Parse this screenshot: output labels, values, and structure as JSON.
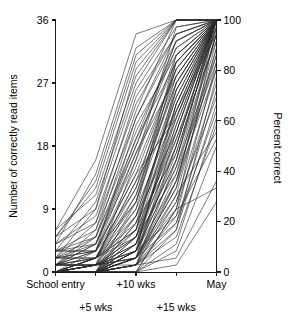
{
  "chart_data": {
    "type": "line",
    "title": "",
    "subtitle": "",
    "xlabel": "",
    "ylabel": "Number of correctly read items",
    "ylabel_right": "Percent correct",
    "categories": [
      "School entry",
      "+5 wks",
      "+10 wks",
      "+15 wks",
      "May"
    ],
    "x": [
      0,
      1,
      2,
      3,
      4
    ],
    "ylim": [
      0,
      36
    ],
    "yticks": [
      0,
      9,
      18,
      27,
      36
    ],
    "yticklabels": [
      "0",
      "9",
      "18",
      "27",
      "36"
    ],
    "ylim_right": [
      0,
      100
    ],
    "yticks_right": [
      0,
      20,
      40,
      60,
      80,
      100
    ],
    "yticklabels_right": [
      "0",
      "20",
      "40",
      "60",
      "80",
      "100"
    ],
    "grid": false,
    "legend": "none",
    "line_color": "#2b2b2b",
    "series": [
      {
        "name": "child-01",
        "values": [
          0,
          0,
          1,
          16,
          36
        ]
      },
      {
        "name": "child-02",
        "values": [
          0,
          0,
          2,
          20,
          36
        ]
      },
      {
        "name": "child-03",
        "values": [
          0,
          1,
          3,
          24,
          36
        ]
      },
      {
        "name": "child-04",
        "values": [
          0,
          0,
          0,
          9,
          35
        ]
      },
      {
        "name": "child-05",
        "values": [
          1,
          2,
          6,
          27,
          36
        ]
      },
      {
        "name": "child-06",
        "values": [
          0,
          0,
          4,
          22,
          36
        ]
      },
      {
        "name": "child-07",
        "values": [
          2,
          3,
          12,
          30,
          36
        ]
      },
      {
        "name": "child-08",
        "values": [
          0,
          1,
          2,
          14,
          34
        ]
      },
      {
        "name": "child-09",
        "values": [
          0,
          0,
          1,
          11,
          32
        ]
      },
      {
        "name": "child-10",
        "values": [
          3,
          5,
          18,
          33,
          36
        ]
      },
      {
        "name": "child-11",
        "values": [
          0,
          0,
          3,
          18,
          36
        ]
      },
      {
        "name": "child-12",
        "values": [
          1,
          1,
          8,
          25,
          36
        ]
      },
      {
        "name": "child-13",
        "values": [
          0,
          2,
          10,
          28,
          36
        ]
      },
      {
        "name": "child-14",
        "values": [
          0,
          0,
          0,
          6,
          28
        ]
      },
      {
        "name": "child-15",
        "values": [
          4,
          7,
          22,
          34,
          36
        ]
      },
      {
        "name": "child-16",
        "values": [
          0,
          1,
          5,
          21,
          36
        ]
      },
      {
        "name": "child-17",
        "values": [
          0,
          0,
          2,
          13,
          33
        ]
      },
      {
        "name": "child-18",
        "values": [
          2,
          4,
          16,
          31,
          36
        ]
      },
      {
        "name": "child-19",
        "values": [
          0,
          0,
          1,
          8,
          30
        ]
      },
      {
        "name": "child-20",
        "values": [
          1,
          3,
          14,
          29,
          36
        ]
      },
      {
        "name": "child-21",
        "values": [
          0,
          0,
          7,
          26,
          36
        ]
      },
      {
        "name": "child-22",
        "values": [
          5,
          9,
          26,
          35,
          36
        ]
      },
      {
        "name": "child-23",
        "values": [
          0,
          1,
          4,
          19,
          35
        ]
      },
      {
        "name": "child-24",
        "values": [
          0,
          0,
          2,
          12,
          31
        ]
      },
      {
        "name": "child-25",
        "values": [
          0,
          2,
          9,
          23,
          36
        ]
      },
      {
        "name": "child-26",
        "values": [
          1,
          1,
          3,
          15,
          34
        ]
      },
      {
        "name": "child-27",
        "values": [
          0,
          0,
          0,
          4,
          22
        ]
      },
      {
        "name": "child-28",
        "values": [
          3,
          6,
          20,
          32,
          36
        ]
      },
      {
        "name": "child-29",
        "values": [
          0,
          0,
          1,
          10,
          29
        ]
      },
      {
        "name": "child-30",
        "values": [
          2,
          2,
          11,
          27,
          36
        ]
      },
      {
        "name": "child-31",
        "values": [
          0,
          1,
          6,
          24,
          36
        ]
      },
      {
        "name": "child-32",
        "values": [
          0,
          0,
          3,
          17,
          35
        ]
      },
      {
        "name": "child-33",
        "values": [
          1,
          4,
          17,
          30,
          36
        ]
      },
      {
        "name": "child-34",
        "values": [
          0,
          0,
          2,
          7,
          26
        ]
      },
      {
        "name": "child-35",
        "values": [
          6,
          11,
          28,
          36,
          36
        ]
      },
      {
        "name": "child-36",
        "values": [
          0,
          0,
          5,
          20,
          36
        ]
      },
      {
        "name": "child-37",
        "values": [
          0,
          2,
          13,
          28,
          36
        ]
      },
      {
        "name": "child-38",
        "values": [
          1,
          1,
          2,
          9,
          27
        ]
      },
      {
        "name": "child-39",
        "values": [
          0,
          0,
          8,
          25,
          36
        ]
      },
      {
        "name": "child-40",
        "values": [
          2,
          5,
          19,
          33,
          36
        ]
      },
      {
        "name": "child-41",
        "values": [
          0,
          1,
          1,
          5,
          21
        ]
      },
      {
        "name": "child-42",
        "values": [
          0,
          0,
          4,
          16,
          34
        ]
      },
      {
        "name": "child-43",
        "values": [
          3,
          3,
          15,
          29,
          36
        ]
      },
      {
        "name": "child-44",
        "values": [
          0,
          0,
          0,
          3,
          18
        ]
      },
      {
        "name": "child-45",
        "values": [
          1,
          2,
          7,
          22,
          36
        ]
      },
      {
        "name": "child-46",
        "values": [
          0,
          0,
          10,
          26,
          36
        ]
      },
      {
        "name": "child-47",
        "values": [
          4,
          8,
          24,
          34,
          36
        ]
      },
      {
        "name": "child-48",
        "values": [
          0,
          1,
          3,
          13,
          32
        ]
      },
      {
        "name": "child-49",
        "values": [
          0,
          0,
          2,
          18,
          36
        ]
      },
      {
        "name": "child-50",
        "values": [
          2,
          3,
          21,
          31,
          36
        ]
      },
      {
        "name": "child-51",
        "values": [
          0,
          0,
          1,
          6,
          24
        ]
      },
      {
        "name": "child-52",
        "values": [
          1,
          6,
          23,
          36,
          36
        ]
      },
      {
        "name": "child-53",
        "values": [
          0,
          2,
          12,
          27,
          36
        ]
      },
      {
        "name": "child-54",
        "values": [
          0,
          0,
          5,
          14,
          30
        ]
      },
      {
        "name": "child-55",
        "values": [
          3,
          4,
          18,
          32,
          36
        ]
      },
      {
        "name": "child-56",
        "values": [
          0,
          1,
          9,
          30,
          36
        ]
      },
      {
        "name": "child-57",
        "values": [
          0,
          0,
          2,
          11,
          20
        ]
      },
      {
        "name": "child-58",
        "values": [
          5,
          12,
          30,
          36,
          36
        ]
      },
      {
        "name": "child-59",
        "values": [
          0,
          0,
          3,
          23,
          36
        ]
      },
      {
        "name": "child-60",
        "values": [
          1,
          1,
          16,
          35,
          36
        ]
      },
      {
        "name": "child-61",
        "values": [
          0,
          2,
          6,
          19,
          33
        ]
      },
      {
        "name": "child-62",
        "values": [
          0,
          0,
          1,
          2,
          13
        ]
      },
      {
        "name": "child-63",
        "values": [
          2,
          7,
          25,
          34,
          36
        ]
      },
      {
        "name": "child-64",
        "values": [
          0,
          0,
          4,
          21,
          36
        ]
      },
      {
        "name": "child-65",
        "values": [
          1,
          3,
          14,
          22,
          36
        ]
      },
      {
        "name": "child-66",
        "values": [
          0,
          1,
          2,
          12,
          36
        ]
      },
      {
        "name": "child-67",
        "values": [
          0,
          0,
          0,
          9,
          12
        ]
      },
      {
        "name": "child-68",
        "values": [
          3,
          10,
          27,
          36,
          36
        ]
      },
      {
        "name": "child-69",
        "values": [
          0,
          0,
          7,
          17,
          35
        ]
      },
      {
        "name": "child-70",
        "values": [
          1,
          2,
          5,
          24,
          36
        ]
      },
      {
        "name": "child-71",
        "values": [
          0,
          1,
          11,
          29,
          36
        ]
      },
      {
        "name": "child-72",
        "values": [
          0,
          0,
          1,
          7,
          23
        ]
      },
      {
        "name": "child-73",
        "values": [
          4,
          14,
          32,
          36,
          36
        ]
      },
      {
        "name": "child-74",
        "values": [
          2,
          2,
          8,
          20,
          36
        ]
      },
      {
        "name": "child-75",
        "values": [
          0,
          0,
          3,
          15,
          31
        ]
      },
      {
        "name": "child-76",
        "values": [
          1,
          5,
          22,
          33,
          36
        ]
      },
      {
        "name": "child-77",
        "values": [
          0,
          0,
          2,
          10,
          25
        ]
      },
      {
        "name": "child-78",
        "values": [
          0,
          3,
          17,
          28,
          36
        ]
      },
      {
        "name": "child-79",
        "values": [
          6,
          16,
          34,
          36,
          36
        ]
      },
      {
        "name": "child-80",
        "values": [
          0,
          0,
          6,
          26,
          36
        ]
      },
      {
        "name": "child-81",
        "values": [
          1,
          1,
          4,
          16,
          36
        ]
      },
      {
        "name": "child-82",
        "values": [
          0,
          2,
          13,
          23,
          34
        ]
      },
      {
        "name": "child-83",
        "values": [
          0,
          0,
          0,
          1,
          10
        ]
      },
      {
        "name": "child-84",
        "values": [
          2,
          9,
          29,
          36,
          36
        ]
      },
      {
        "name": "child-85",
        "values": [
          0,
          1,
          5,
          18,
          36
        ]
      },
      {
        "name": "child-86",
        "values": [
          3,
          3,
          10,
          31,
          36
        ]
      },
      {
        "name": "child-87",
        "values": [
          0,
          0,
          1,
          13,
          29
        ]
      },
      {
        "name": "child-88",
        "values": [
          1,
          4,
          19,
          30,
          36
        ]
      },
      {
        "name": "child-89",
        "values": [
          0,
          0,
          3,
          8,
          19
        ]
      },
      {
        "name": "child-90",
        "values": [
          5,
          13,
          31,
          36,
          36
        ]
      }
    ]
  },
  "axes": {
    "left_title": "Number of correctly read items",
    "right_title": "Percent correct"
  }
}
